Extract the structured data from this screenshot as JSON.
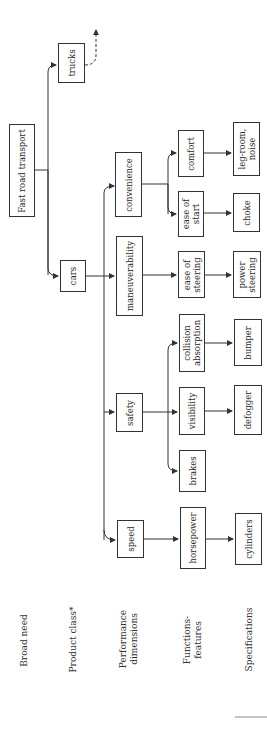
{
  "diagram": {
    "root": "Fast road transport",
    "product_classes": [
      "trucks",
      "cars"
    ],
    "performance_dimensions": [
      "convenience",
      "maneuverability",
      "safety",
      "speed"
    ],
    "functions_features": {
      "comfort": "comfort",
      "ease_of_start": "ease of\nstart",
      "ease_of_steering": "ease of\nsteering",
      "collision_absorption": "collision\nabsorption",
      "visibility": "visibility",
      "brakes": "brakes",
      "horsepower": "horsepower"
    },
    "specifications": {
      "leg_room_noise": "leg-room,\nnoise",
      "choke": "choke",
      "power_steering": "power\nsteering",
      "bumper": "bumper",
      "defogger": "defogger",
      "cylinders": "cylinders"
    },
    "level_labels": {
      "broad_need": "Broad need",
      "product_class": "Product class*",
      "performance": "Performance\ndimensions",
      "functions": "Functions-\nfeatures",
      "specifications": "Specifications"
    },
    "line_color": "#333333"
  }
}
